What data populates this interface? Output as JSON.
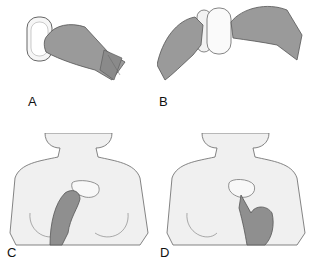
{
  "figure": {
    "panels": [
      {
        "id": "A",
        "label": "A",
        "description": "Gloved hand holding a gel-filled pad"
      },
      {
        "id": "B",
        "label": "B",
        "description": "Two gloved hands peeling apart the pad backing"
      },
      {
        "id": "C",
        "label": "C",
        "description": "Gloved hand placing pad on upper chest of female torso"
      },
      {
        "id": "D",
        "label": "D",
        "description": "Gloved finger pressing pad onto chest"
      }
    ],
    "colors": {
      "glove": "#9a9a9a",
      "skin": "#efefef",
      "outline": "#555555",
      "pad": "#f4f4f4",
      "background": "#ffffff"
    }
  }
}
